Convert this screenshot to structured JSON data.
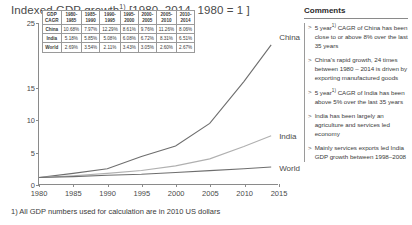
{
  "title": {
    "text_before": "Indexed GDP growth",
    "superscript": "1)",
    "text_after": " [1980–2014, 1980 = 1 ]"
  },
  "chart_data": {
    "type": "line",
    "xlabel": "",
    "ylabel": "GDP growth, x times",
    "xlim": [
      1980,
      2015
    ],
    "ylim": [
      0,
      25
    ],
    "yticks": [
      0,
      5,
      10,
      15,
      25
    ],
    "xticks": [
      1980,
      1985,
      1990,
      1995,
      2000,
      2005,
      2010,
      2015
    ],
    "grid": false,
    "legend_position": "right-inline",
    "x": [
      1980,
      1985,
      1990,
      1995,
      2000,
      2005,
      2010,
      2014
    ],
    "series": [
      {
        "name": "China",
        "color": "#6e6e6e",
        "values": [
          1.0,
          1.65,
          2.38,
          4.28,
          5.9,
          9.41,
          15.9,
          21.6
        ]
      },
      {
        "name": "India",
        "color": "#b0b0b0",
        "values": [
          1.0,
          1.29,
          1.65,
          2.1,
          2.82,
          3.9,
          5.82,
          7.49
        ]
      },
      {
        "name": "World",
        "color": "#6e6e6e",
        "values": [
          1.0,
          1.14,
          1.36,
          1.51,
          1.79,
          2.08,
          2.37,
          2.63
        ]
      }
    ]
  },
  "table": {
    "corner_label_line1": "GDP",
    "corner_label_line2": "CAGR",
    "columns": [
      {
        "line1": "1980-",
        "line2": "1985"
      },
      {
        "line1": "1985-",
        "line2": "1990"
      },
      {
        "line1": "1990-",
        "line2": "1995"
      },
      {
        "line1": "1995-",
        "line2": "2000"
      },
      {
        "line1": "2000-",
        "line2": "2005"
      },
      {
        "line1": "2005-",
        "line2": "2010"
      },
      {
        "line1": "2010-",
        "line2": "2014"
      }
    ],
    "rows": [
      {
        "label": "China",
        "values": [
          "10.68%",
          "7.97%",
          "12.29%",
          "8.61%",
          "9.76%",
          "11.26%",
          "8.06%"
        ]
      },
      {
        "label": "India",
        "values": [
          "5.18%",
          "5.85%",
          "5.08%",
          "6.08%",
          "6.72%",
          "8.31%",
          "6.51%"
        ]
      },
      {
        "label": "World",
        "values": [
          "2.69%",
          "3.54%",
          "2.11%",
          "3.43%",
          "3.05%",
          "2.60%",
          "2.67%"
        ]
      }
    ]
  },
  "series_labels": [
    {
      "name": "China"
    },
    {
      "name": "India"
    },
    {
      "name": "World"
    }
  ],
  "comments": {
    "heading": "Comments",
    "bullets": [
      {
        "marker": ">",
        "text_before": "5 year",
        "superscript": "1)",
        "text_after": " CAGR of China has been close to or above 8% over the last 35 years"
      },
      {
        "marker": ">",
        "text_before": "China's rapid growth, 24 times between 1980 – 2014 is driven by exporting manufactured goods",
        "superscript": "",
        "text_after": ""
      },
      {
        "marker": ">",
        "text_before": "5 year",
        "superscript": "1)",
        "text_after": "  CAGR of India has been above 5% over the last 35 years"
      },
      {
        "marker": ">",
        "text_before": "India has been largely an agriculture and services led economy",
        "superscript": "",
        "text_after": ""
      },
      {
        "marker": ">",
        "text_before": "Mainly services exports led India GDP growth between 1998–2008",
        "superscript": "",
        "text_after": ""
      }
    ]
  },
  "footnote": {
    "text": "1) All GDP numbers used for calculation are in 2010 US dollars"
  }
}
